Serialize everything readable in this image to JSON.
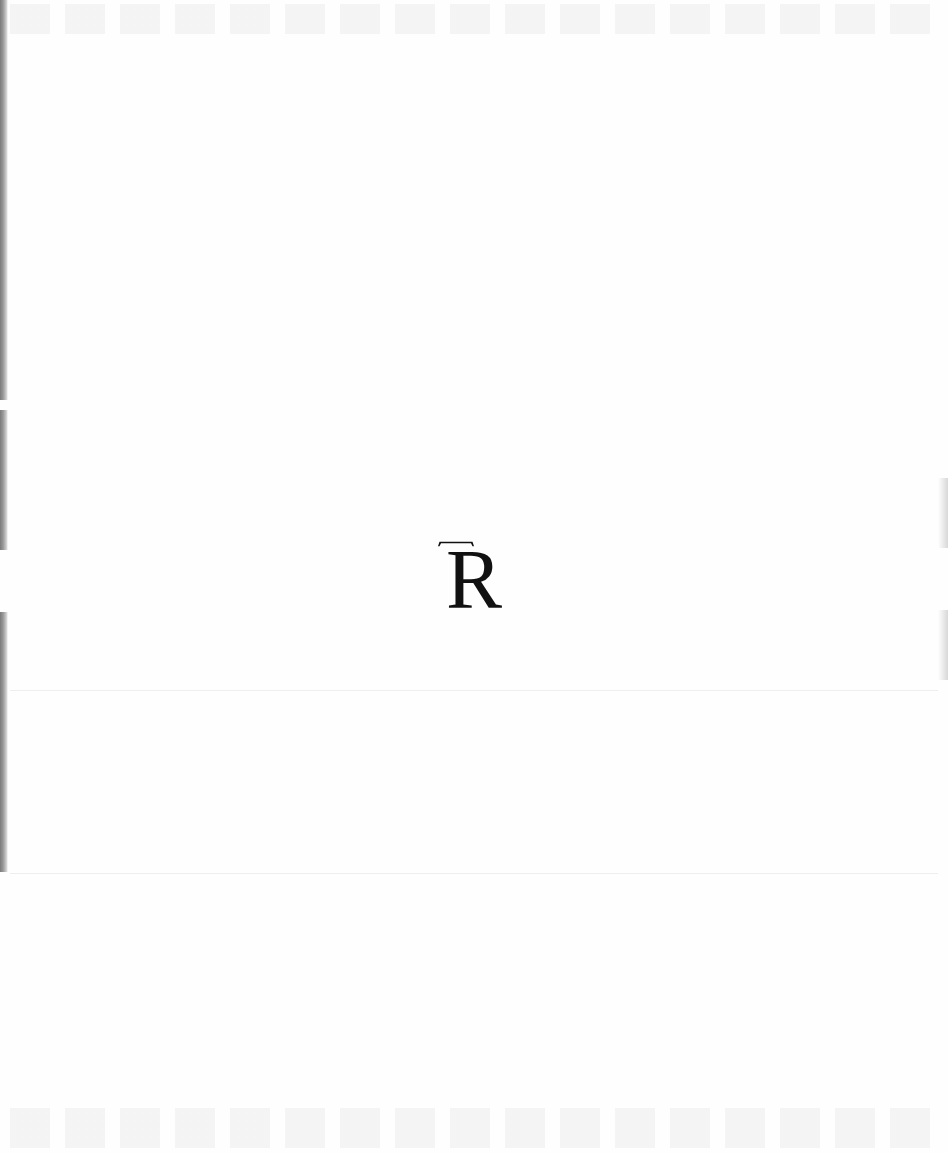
{
  "document": {
    "type": "scanned-page",
    "monogram": {
      "letters": "TR",
      "first_letter": "T",
      "second_letter": "R",
      "color": "#111111"
    },
    "background_color": "#fefefe"
  }
}
